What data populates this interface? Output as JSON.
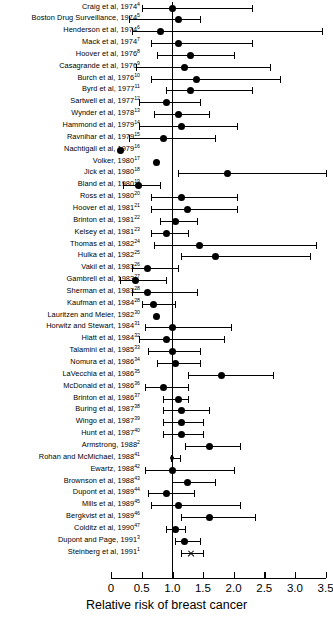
{
  "chart_data": {
    "type": "forest",
    "title": "",
    "xlabel": "Relative risk of breast cancer",
    "ylabel": "",
    "xlim": [
      0,
      3.5
    ],
    "xticks": [
      0,
      0.5,
      1.0,
      1.5,
      2.0,
      2.5,
      3.0,
      3.5
    ],
    "xtick_labels": [
      "0",
      "0.5",
      "1.0",
      "1.5",
      "2.0",
      "2.5",
      "3.0",
      "3.5"
    ],
    "reference_line": 1.0,
    "grid": false,
    "legend": "none",
    "marker": "filled-circle",
    "studies": [
      {
        "label": "Craig et al, 1974",
        "ref": "4",
        "rr": 1.0,
        "lo": 0.5,
        "hi": 2.3,
        "marker": "circle"
      },
      {
        "label": "Boston Drug Surveillance, 1974",
        "ref": "5",
        "rr": 1.1,
        "lo": 0.3,
        "hi": 1.45,
        "marker": "circle"
      },
      {
        "label": "Henderson et al, 1974",
        "ref": "6",
        "rr": 0.8,
        "lo": 0.35,
        "hi": 3.45,
        "marker": "circle"
      },
      {
        "label": "Mack et al, 1974",
        "ref": "7",
        "rr": 1.1,
        "lo": 0.65,
        "hi": 2.3,
        "marker": "circle"
      },
      {
        "label": "Hoover et al, 1976",
        "ref": "8",
        "rr": 1.3,
        "lo": 0.75,
        "hi": 2.0,
        "marker": "circle"
      },
      {
        "label": "Casagrande et al, 1976",
        "ref": "9",
        "rr": 1.2,
        "lo": 0.4,
        "hi": 2.6,
        "marker": "circle"
      },
      {
        "label": "Burch et al, 1976",
        "ref": "10",
        "rr": 1.4,
        "lo": 0.65,
        "hi": 2.75,
        "marker": "circle"
      },
      {
        "label": "Byrd et al, 1977",
        "ref": "11",
        "rr": 1.3,
        "lo": 0.9,
        "hi": 2.3,
        "marker": "circle"
      },
      {
        "label": "Sartwell et al, 1977",
        "ref": "12",
        "rr": 0.9,
        "lo": 0.45,
        "hi": 1.45,
        "marker": "circle"
      },
      {
        "label": "Wynder et al, 1978",
        "ref": "13",
        "rr": 1.1,
        "lo": 0.7,
        "hi": 1.6,
        "marker": "circle"
      },
      {
        "label": "Hammond et al, 1979",
        "ref": "14",
        "rr": 1.15,
        "lo": 0.45,
        "hi": 2.05,
        "marker": "circle"
      },
      {
        "label": "Ravnihar et al, 1979",
        "ref": "15",
        "rr": 0.85,
        "lo": 0.3,
        "hi": 1.7,
        "marker": "circle"
      },
      {
        "label": "Nachtigall et al, 1979",
        "ref": "16",
        "rr": 0.15,
        "lo": 0.15,
        "hi": 0.15,
        "marker": "circle"
      },
      {
        "label": "Volker, 1980",
        "ref": "17",
        "rr": 0.75,
        "lo": 0.75,
        "hi": 0.75,
        "marker": "circle"
      },
      {
        "label": "Jick et al, 1980",
        "ref": "18",
        "rr": 1.9,
        "lo": 1.1,
        "hi": 3.5,
        "marker": "circle"
      },
      {
        "label": "Bland et al, 1980",
        "ref": "19",
        "rr": 0.45,
        "lo": 0.2,
        "hi": 0.8,
        "marker": "circle"
      },
      {
        "label": "Ross et al, 1980",
        "ref": "20",
        "rr": 1.15,
        "lo": 0.65,
        "hi": 2.05,
        "marker": "circle"
      },
      {
        "label": "Hoover et al, 1981",
        "ref": "21",
        "rr": 1.25,
        "lo": 0.65,
        "hi": 2.05,
        "marker": "circle"
      },
      {
        "label": "Brinton et al, 1981",
        "ref": "22",
        "rr": 1.05,
        "lo": 0.8,
        "hi": 1.4,
        "marker": "circle"
      },
      {
        "label": "Kelsey et al, 1981",
        "ref": "23",
        "rr": 0.9,
        "lo": 0.65,
        "hi": 1.25,
        "marker": "circle"
      },
      {
        "label": "Thomas et al, 1982",
        "ref": "24",
        "rr": 1.45,
        "lo": 0.7,
        "hi": 3.35,
        "marker": "circle"
      },
      {
        "label": "Hulka et al, 1982",
        "ref": "25",
        "rr": 1.7,
        "lo": 1.15,
        "hi": 3.25,
        "marker": "circle"
      },
      {
        "label": "Vakil et al, 1983",
        "ref": "26",
        "rr": 0.6,
        "lo": 0.35,
        "hi": 1.1,
        "marker": "circle"
      },
      {
        "label": "Gambrell et al, 1983",
        "ref": "27",
        "rr": 0.4,
        "lo": 0.15,
        "hi": 0.9,
        "marker": "circle"
      },
      {
        "label": "Sherman et al, 1983",
        "ref": "28",
        "rr": 0.6,
        "lo": 0.35,
        "hi": 1.4,
        "marker": "circle"
      },
      {
        "label": "Kaufman et al, 1984",
        "ref": "28",
        "rr": 0.7,
        "lo": 0.5,
        "hi": 1.05,
        "marker": "circle"
      },
      {
        "label": "Lauritzen and Meier, 1982",
        "ref": "30",
        "rr": 0.75,
        "lo": 0.75,
        "hi": 0.75,
        "marker": "circle"
      },
      {
        "label": "Horwitz and Stewart, 1984",
        "ref": "31",
        "rr": 1.0,
        "lo": 0.55,
        "hi": 1.95,
        "marker": "circle"
      },
      {
        "label": "Hiatt et al, 1984",
        "ref": "32",
        "rr": 0.9,
        "lo": 0.45,
        "hi": 1.85,
        "marker": "circle"
      },
      {
        "label": "Talamini et al, 1985",
        "ref": "33",
        "rr": 1.0,
        "lo": 0.6,
        "hi": 1.45,
        "marker": "circle"
      },
      {
        "label": "Nomura et al, 1986",
        "ref": "34",
        "rr": 1.05,
        "lo": 0.75,
        "hi": 1.45,
        "marker": "circle"
      },
      {
        "label": "LaVecchia et al, 1986",
        "ref": "35",
        "rr": 1.8,
        "lo": 1.25,
        "hi": 2.65,
        "marker": "circle"
      },
      {
        "label": "McDonald et al, 1986",
        "ref": "36",
        "rr": 0.85,
        "lo": 0.55,
        "hi": 1.25,
        "marker": "circle"
      },
      {
        "label": "Brinton et al, 1986",
        "ref": "37",
        "rr": 1.1,
        "lo": 0.85,
        "hi": 1.25,
        "marker": "circle"
      },
      {
        "label": "Buring et al, 1987",
        "ref": "38",
        "rr": 1.15,
        "lo": 0.85,
        "hi": 1.6,
        "marker": "circle"
      },
      {
        "label": "Wingo et al, 1987",
        "ref": "39",
        "rr": 1.15,
        "lo": 0.85,
        "hi": 1.5,
        "marker": "circle"
      },
      {
        "label": "Hunt et al, 1987",
        "ref": "40",
        "rr": 1.15,
        "lo": 0.85,
        "hi": 1.5,
        "marker": "circle"
      },
      {
        "label": "Armstrong, 1988",
        "ref": "2",
        "rr": 1.6,
        "lo": 1.2,
        "hi": 2.1,
        "marker": "circle"
      },
      {
        "label": "Rohan and McMichael, 1988",
        "ref": "41",
        "rr": 1.0,
        "lo": 0.98,
        "hi": 1.12,
        "marker": "small"
      },
      {
        "label": "Ewartz, 1988",
        "ref": "42",
        "rr": 1.0,
        "lo": 0.55,
        "hi": 2.0,
        "marker": "circle"
      },
      {
        "label": "Brownson et al, 1988",
        "ref": "43",
        "rr": 1.25,
        "lo": 1.0,
        "hi": 1.7,
        "marker": "circle"
      },
      {
        "label": "Dupont et al, 1989",
        "ref": "44",
        "rr": 0.9,
        "lo": 0.6,
        "hi": 1.35,
        "marker": "circle"
      },
      {
        "label": "Mills et al, 1989",
        "ref": "45",
        "rr": 1.1,
        "lo": 0.65,
        "hi": 2.1,
        "marker": "circle"
      },
      {
        "label": "Bergkvist et al, 1989",
        "ref": "46",
        "rr": 1.6,
        "lo": 1.15,
        "hi": 2.35,
        "marker": "circle"
      },
      {
        "label": "Colditz et al, 1990",
        "ref": "47",
        "rr": 1.05,
        "lo": 0.9,
        "hi": 1.2,
        "marker": "circle"
      },
      {
        "label": "Dupont and Page, 1991",
        "ref": "3",
        "rr": 1.2,
        "lo": 1.05,
        "hi": 1.45,
        "marker": "circle"
      },
      {
        "label": "Steinberg et al, 1991",
        "ref": "1",
        "rr": 1.3,
        "lo": 1.15,
        "hi": 1.5,
        "marker": "x"
      }
    ]
  }
}
